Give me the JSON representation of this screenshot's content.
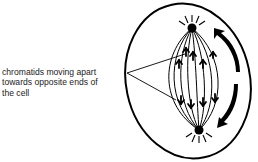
{
  "diagram": {
    "label": {
      "lines": [
        "chromatids moving apart",
        "towards opposite ends of",
        "the cell"
      ]
    },
    "elements": {
      "cell_membrane": "oval outline",
      "spindle_poles": [
        "top pole",
        "bottom pole"
      ],
      "spindle_fibres": "curved lines between poles",
      "chromatids": [
        "upper group moving up",
        "lower group moving down"
      ],
      "arrows": [
        "curved arrow pointing up",
        "curved arrow pointing down"
      ]
    },
    "colors": {
      "ink": "#000000",
      "background": "#ffffff",
      "text": "#222222"
    }
  }
}
